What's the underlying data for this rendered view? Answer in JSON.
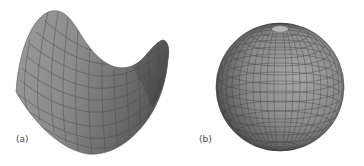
{
  "figure": {
    "panels": [
      {
        "id": "a",
        "label": "(a)",
        "shape": "saddle-surface",
        "description": "Hyperbolic paraboloid (saddle) mesh surface with gray shading"
      },
      {
        "id": "b",
        "label": "(b)",
        "shape": "sphere",
        "description": "Sphere with latitude/longitude mesh grid and gray shading"
      }
    ],
    "colors": {
      "surface_light": "#a8a8a8",
      "surface_mid": "#8a8a8a",
      "surface_dark": "#5a5a5a",
      "mesh_line": "#4a4a4a",
      "background": "#ffffff"
    }
  }
}
